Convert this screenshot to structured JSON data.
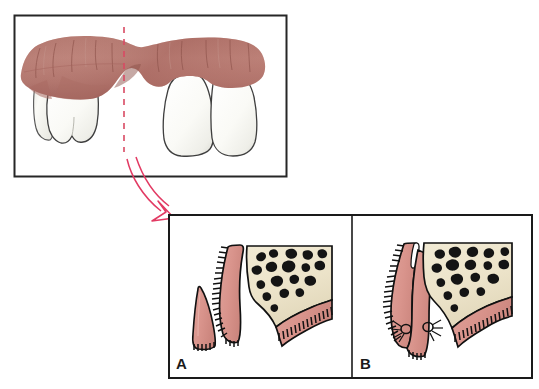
{
  "figure": {
    "background_color": "#ffffff",
    "panels": [
      {
        "id": "overview",
        "name": "clinical-overview-panel",
        "label": "",
        "border_color": "#262626",
        "frame": {
          "x": 14,
          "y": 15,
          "w": 273,
          "h": 162
        },
        "description": "Buccal clinical view of the mandibular arch showing an edentulous ridge flanked by teeth, with a dashed red section line marking the plane of the cross-sections below."
      },
      {
        "id": "A",
        "name": "cross-section-panel-a",
        "label": "A",
        "border_color": "#1a1a1a",
        "frame": {
          "x": 168,
          "y": 214,
          "w": 184,
          "h": 165
        },
        "description": "Cross-section showing the recipient bed prepared on the ridge with the free gingival graft harvested and held separately."
      },
      {
        "id": "B",
        "name": "cross-section-panel-b",
        "label": "B",
        "border_color": "#1a1a1a",
        "frame": {
          "x": 352,
          "y": 214,
          "w": 181,
          "h": 165
        },
        "description": "Cross-section showing the graft positioned on the recipient bed and secured with two interrupted sutures."
      }
    ],
    "annotations": {
      "section_line": {
        "name": "section-plane-dashed-line",
        "color": "#d94a63",
        "style": "dashed",
        "x": 124,
        "y_top": 27,
        "y_bottom": 152
      },
      "arrow": {
        "name": "magnification-arrow",
        "color": "#e23a63",
        "fill": "none",
        "from_x": 128,
        "from_y": 160,
        "to_x": 172,
        "to_y": 218,
        "head_style": "open-outline-triangle"
      }
    },
    "colors": {
      "gingiva_clinical_light": "#c08b82",
      "gingiva_clinical_mid": "#b0746b",
      "gingiva_clinical_dark": "#9a5c55",
      "gingiva_section": "#d9948c",
      "gingiva_section_shadow": "#c4827a",
      "tooth_enamel": "#fbfbf8",
      "tooth_shadow": "#e2e2dd",
      "tooth_outline": "#4a4a4a",
      "bone_cancellous": "#ece3c9",
      "marrow_space": "#141414",
      "outline": "#111111",
      "suture_thread": "#111111",
      "graft_highlight": "#ffffff",
      "panel_border": "#1a1a1a",
      "label_text": "#1a1a1a"
    },
    "labels": {
      "panel_a": "A",
      "panel_b": "B"
    }
  }
}
